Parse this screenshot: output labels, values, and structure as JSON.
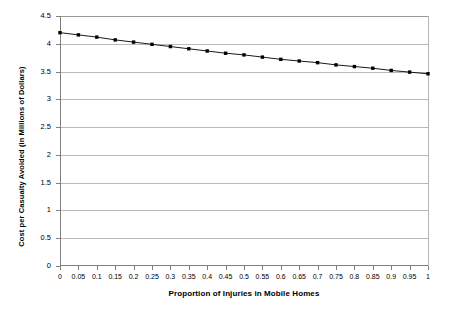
{
  "chart_data": {
    "type": "line",
    "title": "",
    "xlabel": "Proportion of Injuries in Mobile Homes",
    "ylabel": "Cost per Casualty Avoided (in Millions of Dollars)",
    "xlim": [
      0,
      1
    ],
    "ylim": [
      0,
      4.5
    ],
    "grid": true,
    "legend": "none",
    "x_tick_labels": [
      "0",
      "0.05",
      "0.1",
      "0.15",
      "0.2",
      "0.25",
      "0.3",
      "0.35",
      "0.4",
      "0.45",
      "0.5",
      "0.55",
      "0.6",
      "0.65",
      "0.7",
      "0.75",
      "0.8",
      "0.85",
      "0.9",
      "0.95",
      "1"
    ],
    "y_tick_labels": [
      "0",
      "0.5",
      "1",
      "1.5",
      "2",
      "2.5",
      "3",
      "3.5",
      "4",
      "4.5"
    ],
    "x": [
      0,
      0.05,
      0.1,
      0.15,
      0.2,
      0.25,
      0.3,
      0.35,
      0.4,
      0.45,
      0.5,
      0.55,
      0.6,
      0.65,
      0.7,
      0.75,
      0.8,
      0.85,
      0.9,
      0.95,
      1
    ],
    "series": [
      {
        "name": "Cost per Casualty Avoided",
        "marker": "square",
        "color": "#000000",
        "values": [
          4.2,
          4.16,
          4.12,
          4.07,
          4.03,
          3.99,
          3.95,
          3.91,
          3.87,
          3.83,
          3.8,
          3.76,
          3.72,
          3.69,
          3.66,
          3.62,
          3.59,
          3.56,
          3.52,
          3.49,
          3.46
        ]
      }
    ]
  },
  "colors": {
    "series": "#000000",
    "gridline": "#b9b9b9",
    "axis": "#808080",
    "background": "#ffffff"
  }
}
